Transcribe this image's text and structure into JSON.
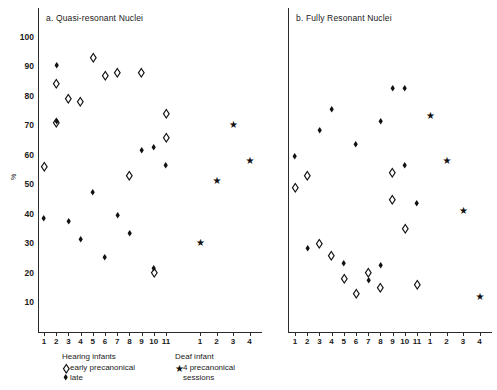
{
  "figure": {
    "width": 497,
    "height": 390,
    "background": "#ffffff",
    "ink_color": "#111111"
  },
  "y_axis": {
    "label": "%",
    "ticks": [
      10,
      20,
      30,
      40,
      50,
      60,
      70,
      80,
      90,
      100
    ],
    "min": 0,
    "max": 105
  },
  "legend": {
    "hearing_heading": "Hearing infants",
    "hearing_early_label": "early precanonical",
    "hearing_early_marker": "open-diamond",
    "hearing_late_label": "late",
    "hearing_late_marker": "filled-diamond",
    "deaf_heading": "Deaf infant",
    "deaf_label_line1": "4 precanonical",
    "deaf_label_line2": "sessions",
    "deaf_marker": "star"
  },
  "chart_data": {
    "type": "scatter",
    "title": "",
    "xlabel": "",
    "ylabel": "%",
    "ylim": [
      0,
      105
    ],
    "grid": false,
    "legend_position": "below-plot",
    "panels": [
      {
        "id": "a",
        "title": "a.  Quasi-resonant Nuclei",
        "groups": [
          {
            "name": "Hearing infants",
            "xticks": [
              "1",
              "2",
              "3",
              "4",
              "5",
              "6",
              "7",
              "8",
              "9",
              "10",
              "11"
            ],
            "series": [
              {
                "name": "early precanonical",
                "marker": "open-diamond",
                "points": [
                  {
                    "x": 1,
                    "y": 56
                  },
                  {
                    "x": 2,
                    "y": 71
                  },
                  {
                    "x": 2,
                    "y": 84
                  },
                  {
                    "x": 3,
                    "y": 79
                  },
                  {
                    "x": 4,
                    "y": 78
                  },
                  {
                    "x": 5,
                    "y": 93
                  },
                  {
                    "x": 6,
                    "y": 87
                  },
                  {
                    "x": 7,
                    "y": 88
                  },
                  {
                    "x": 8,
                    "y": 53
                  },
                  {
                    "x": 9,
                    "y": 88
                  },
                  {
                    "x": 10,
                    "y": 20
                  },
                  {
                    "x": 11,
                    "y": 74
                  },
                  {
                    "x": 11,
                    "y": 66
                  }
                ]
              },
              {
                "name": "late",
                "marker": "filled-diamond",
                "points": [
                  {
                    "x": 1,
                    "y": 38
                  },
                  {
                    "x": 2,
                    "y": 71
                  },
                  {
                    "x": 2,
                    "y": 90
                  },
                  {
                    "x": 3,
                    "y": 37
                  },
                  {
                    "x": 4,
                    "y": 31
                  },
                  {
                    "x": 5,
                    "y": 47
                  },
                  {
                    "x": 6,
                    "y": 25
                  },
                  {
                    "x": 7,
                    "y": 39
                  },
                  {
                    "x": 8,
                    "y": 33
                  },
                  {
                    "x": 9,
                    "y": 61
                  },
                  {
                    "x": 10,
                    "y": 21
                  },
                  {
                    "x": 10,
                    "y": 62
                  },
                  {
                    "x": 11,
                    "y": 56
                  }
                ]
              }
            ]
          },
          {
            "name": "Deaf infant",
            "xticks": [
              "1",
              "2",
              "3",
              "4"
            ],
            "series": [
              {
                "name": "4 precanonical sessions",
                "marker": "star",
                "points": [
                  {
                    "x": 1,
                    "y": 30
                  },
                  {
                    "x": 2,
                    "y": 51
                  },
                  {
                    "x": 3,
                    "y": 70
                  },
                  {
                    "x": 4,
                    "y": 58
                  }
                ]
              }
            ]
          }
        ]
      },
      {
        "id": "b",
        "title": "b.  Fully Resonant Nuclei",
        "groups": [
          {
            "name": "Hearing infants",
            "xticks": [
              "1",
              "2",
              "3",
              "4",
              "5",
              "6",
              "7",
              "8",
              "9",
              "10",
              "11"
            ],
            "series": [
              {
                "name": "early precanonical",
                "marker": "open-diamond",
                "points": [
                  {
                    "x": 1,
                    "y": 49
                  },
                  {
                    "x": 2,
                    "y": 53
                  },
                  {
                    "x": 3,
                    "y": 30
                  },
                  {
                    "x": 4,
                    "y": 26
                  },
                  {
                    "x": 5,
                    "y": 18
                  },
                  {
                    "x": 6,
                    "y": 13
                  },
                  {
                    "x": 7,
                    "y": 20
                  },
                  {
                    "x": 8,
                    "y": 15
                  },
                  {
                    "x": 9,
                    "y": 54
                  },
                  {
                    "x": 9,
                    "y": 45
                  },
                  {
                    "x": 10,
                    "y": 35
                  },
                  {
                    "x": 11,
                    "y": 16
                  }
                ]
              },
              {
                "name": "late",
                "marker": "filled-diamond",
                "points": [
                  {
                    "x": 1,
                    "y": 59
                  },
                  {
                    "x": 2,
                    "y": 28
                  },
                  {
                    "x": 3,
                    "y": 68
                  },
                  {
                    "x": 4,
                    "y": 75
                  },
                  {
                    "x": 5,
                    "y": 23
                  },
                  {
                    "x": 6,
                    "y": 63
                  },
                  {
                    "x": 7,
                    "y": 17
                  },
                  {
                    "x": 8,
                    "y": 71
                  },
                  {
                    "x": 8,
                    "y": 22
                  },
                  {
                    "x": 9,
                    "y": 82
                  },
                  {
                    "x": 10,
                    "y": 82
                  },
                  {
                    "x": 10,
                    "y": 56
                  },
                  {
                    "x": 11,
                    "y": 43
                  }
                ]
              }
            ]
          },
          {
            "name": "Deaf infant",
            "xticks": [
              "1",
              "2",
              "3",
              "4"
            ],
            "series": [
              {
                "name": "4 precanonical sessions",
                "marker": "star",
                "points": [
                  {
                    "x": 1,
                    "y": 73
                  },
                  {
                    "x": 2,
                    "y": 58
                  },
                  {
                    "x": 3,
                    "y": 41
                  },
                  {
                    "x": 4,
                    "y": 12
                  }
                ]
              }
            ]
          }
        ]
      }
    ]
  }
}
